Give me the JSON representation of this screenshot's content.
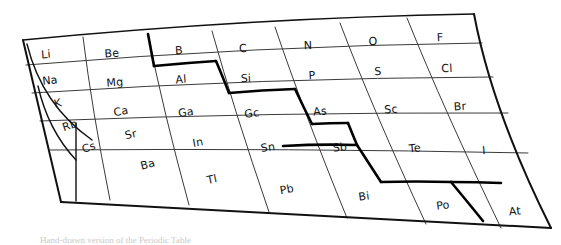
{
  "figure": {
    "style": "hand-drawn pen sketch, perspective-warped grid",
    "ink_color": "#111111",
    "thin_line_color": "#3a3a3a",
    "bold_line_color": "#000000",
    "paper_color": "#ffffff"
  },
  "caption": {
    "text": "Hand-drawn version of the Periodic Table"
  },
  "table": {
    "rows": [
      {
        "period": "2",
        "cells": [
          {
            "symbol": "Li"
          },
          {
            "symbol": "Be"
          },
          {
            "symbol": "B"
          },
          {
            "symbol": "C"
          },
          {
            "symbol": "N"
          },
          {
            "symbol": "O"
          },
          {
            "symbol": "F"
          }
        ]
      },
      {
        "period": "3",
        "cells": [
          {
            "symbol": "Na"
          },
          {
            "symbol": "Mg"
          },
          {
            "symbol": "Al"
          },
          {
            "symbol": "Si"
          },
          {
            "symbol": "P"
          },
          {
            "symbol": "S"
          },
          {
            "symbol": "Cl"
          }
        ]
      },
      {
        "period": "4",
        "cells": [
          {
            "symbol": "K"
          },
          {
            "symbol": "Ca"
          },
          {
            "symbol": "Ga"
          },
          {
            "symbol": "Gc"
          },
          {
            "symbol": "As"
          },
          {
            "symbol": "Sc"
          },
          {
            "symbol": "Br"
          }
        ]
      },
      {
        "period": "5",
        "cells": [
          {
            "symbol": "Rb"
          },
          {
            "symbol": "Sr"
          },
          {
            "symbol": "In"
          },
          {
            "symbol": "Sn"
          },
          {
            "symbol": "Sb"
          },
          {
            "symbol": "Te"
          },
          {
            "symbol": "I"
          }
        ]
      },
      {
        "period": "6",
        "cells": [
          {
            "symbol": "Cs"
          },
          {
            "symbol": "Ba"
          },
          {
            "symbol": "Tl"
          },
          {
            "symbol": "Pb"
          },
          {
            "symbol": "Bi"
          },
          {
            "symbol": "Po"
          },
          {
            "symbol": "At"
          }
        ]
      }
    ],
    "staircase": {
      "name": "metal-nonmetal-divider",
      "description": "bold hand-drawn staircase line separating metals from non-metals, stepping from left of B down past Si, Ge/As, Sb/Te to At"
    }
  },
  "labels": {
    "li": "Li",
    "be": "Be",
    "b": "B",
    "c": "C",
    "n": "N",
    "o": "O",
    "f": "F",
    "na": "Na",
    "mg": "Mg",
    "al": "Al",
    "si": "Si",
    "p": "P",
    "s": "S",
    "cl": "Cl",
    "k": "K",
    "ca": "Ca",
    "ga": "Ga",
    "ge": "Gc",
    "as": "As",
    "se": "Sc",
    "br": "Br",
    "rb": "Rb",
    "sr": "Sr",
    "in": "In",
    "sn": "Sn",
    "sb": "Sb",
    "te": "Te",
    "i": "I",
    "cs": "Cs",
    "ba": "Ba",
    "tl": "Tl",
    "pb": "Pb",
    "bi": "Bi",
    "po": "Po",
    "at": "At"
  }
}
